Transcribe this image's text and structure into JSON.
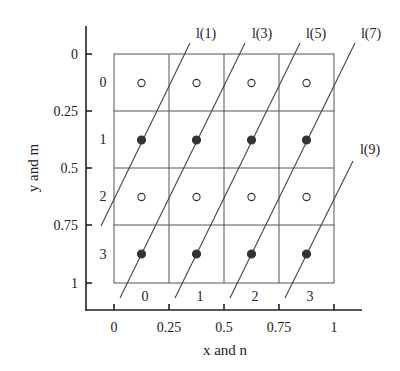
{
  "diagram": {
    "x_axis": {
      "title": "x and n",
      "ticks": [
        "0",
        "0.25",
        "0.5",
        "0.75",
        "1"
      ],
      "cell_labels": [
        "0",
        "1",
        "2",
        "3"
      ]
    },
    "y_axis": {
      "title": "y and m",
      "ticks": [
        "0",
        "0.25",
        "0.5",
        "0.75",
        "1"
      ],
      "cell_labels": [
        "0",
        "1",
        "2",
        "3"
      ]
    },
    "grid": {
      "columns": 4,
      "rows": 4
    },
    "points": {
      "row_styles": [
        "open",
        "filled",
        "open",
        "filled"
      ]
    },
    "lines": [
      {
        "label": "l(1)"
      },
      {
        "label": "l(3)"
      },
      {
        "label": "l(5)"
      },
      {
        "label": "l(7)"
      },
      {
        "label": "l(9)"
      }
    ],
    "colors": {
      "ink": "#222222",
      "grid": "#555555",
      "background": "#ffffff"
    }
  }
}
